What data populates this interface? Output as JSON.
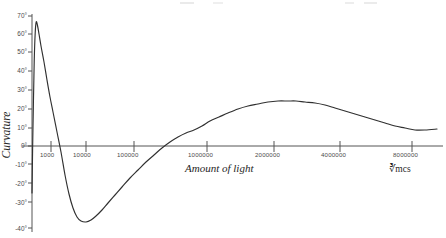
{
  "chart_data": {
    "type": "line",
    "title": "",
    "xlabel": "Amount of light",
    "ylabel": "Curvature",
    "x_unit": "mcs",
    "x_unit_root": "3",
    "x_unit_display": "∛mcs",
    "x_scale": "log-then-linear",
    "xticks": [
      {
        "label": "1000",
        "value": 1000,
        "px": 51
      },
      {
        "label": "10000",
        "value": 10000,
        "px": 86
      },
      {
        "label": "100000",
        "value": 100000,
        "px": 134
      },
      {
        "label": "1000000",
        "value": 1000000,
        "px": 207
      },
      {
        "label": "2000000",
        "value": 2000000,
        "px": 274
      },
      {
        "label": "4000000",
        "value": 4000000,
        "px": 340
      },
      {
        "label": "8000000",
        "value": 8000000,
        "px": 412
      }
    ],
    "yticks": [
      {
        "label": "70°",
        "value": 70
      },
      {
        "label": "60°",
        "value": 60
      },
      {
        "label": "50°",
        "value": 50
      },
      {
        "label": "40°",
        "value": 40
      },
      {
        "label": "30°",
        "value": 30
      },
      {
        "label": "20°",
        "value": 20
      },
      {
        "label": "10°",
        "value": 10
      },
      {
        "label": "0°",
        "value": 0
      },
      {
        "label": "-10°",
        "value": -10
      },
      {
        "label": "-20°",
        "value": -20
      },
      {
        "label": "-30°",
        "value": -30
      },
      {
        "label": "-40°",
        "value": -40
      }
    ],
    "ylim": [
      -40,
      70
    ],
    "grid": false,
    "legend": false,
    "units": "degrees",
    "series": [
      {
        "name": "Curvature",
        "color": "#303030",
        "annotations": {
          "first_peak_deg": 65,
          "first_zero_crossing_label": "1000",
          "trough_deg": -35,
          "second_zero_crossing_label": "1000000",
          "second_peak_deg": 21,
          "end_deg": 8
        },
        "points_px": [
          [
            32,
            193
          ],
          [
            32.6,
            150
          ],
          [
            33.4,
            104
          ],
          [
            34.2,
            62
          ],
          [
            35.2,
            33
          ],
          [
            36.2,
            22
          ],
          [
            37.4,
            25
          ],
          [
            39,
            34
          ],
          [
            41,
            46
          ],
          [
            44,
            62
          ],
          [
            47,
            80
          ],
          [
            50,
            97
          ],
          [
            53,
            112
          ],
          [
            57,
            132
          ],
          [
            61,
            152
          ],
          [
            65,
            175
          ],
          [
            69,
            194
          ],
          [
            73,
            208
          ],
          [
            77,
            217
          ],
          [
            81,
            221
          ],
          [
            86,
            222
          ],
          [
            91,
            220
          ],
          [
            96,
            216
          ],
          [
            102,
            210
          ],
          [
            108,
            203
          ],
          [
            115,
            195
          ],
          [
            122,
            187
          ],
          [
            130,
            178
          ],
          [
            138,
            170
          ],
          [
            146,
            162
          ],
          [
            154,
            155
          ],
          [
            162,
            148
          ],
          [
            170,
            142
          ],
          [
            178,
            137
          ],
          [
            186,
            133
          ],
          [
            194,
            130
          ],
          [
            202,
            126
          ],
          [
            210,
            121
          ],
          [
            219,
            117
          ],
          [
            228,
            113
          ],
          [
            238,
            109
          ],
          [
            248,
            106
          ],
          [
            258,
            104
          ],
          [
            268,
            102
          ],
          [
            278,
            101
          ],
          [
            288,
            101
          ],
          [
            296,
            101
          ],
          [
            305,
            102
          ],
          [
            315,
            103
          ],
          [
            325,
            105
          ],
          [
            335,
            108
          ],
          [
            345,
            111
          ],
          [
            355,
            114
          ],
          [
            365,
            117
          ],
          [
            375,
            120
          ],
          [
            385,
            123
          ],
          [
            395,
            126
          ],
          [
            405,
            128
          ],
          [
            415,
            130
          ],
          [
            425,
            130
          ],
          [
            437,
            129
          ]
        ]
      }
    ]
  },
  "axes": {
    "y_axis_x_px": 32,
    "x_axis_y_px": 146,
    "y_top_px": 14,
    "y_bottom_px": 232,
    "x_left_px": 22,
    "x_right_px": 443
  }
}
